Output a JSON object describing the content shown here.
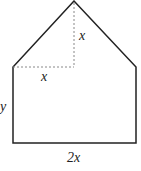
{
  "diagram": {
    "type": "geometric-figure",
    "labels": {
      "triangle_height": "x",
      "half_base": "x",
      "rect_height": "y",
      "base": "2x"
    },
    "colors": {
      "stroke": "#222222",
      "dashed": "#888888",
      "background": "#ffffff"
    }
  }
}
